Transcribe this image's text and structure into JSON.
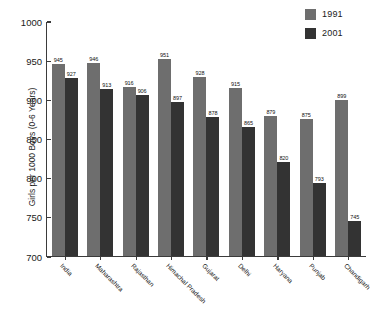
{
  "chart_data": {
    "type": "bar",
    "title": "",
    "subtitle": "",
    "xlabel": "",
    "ylabel": "Girls per 1000 Boys (0-6 Years)",
    "ylim": [
      700,
      1000
    ],
    "yticks": [
      700,
      750,
      800,
      850,
      900,
      950,
      1000
    ],
    "grid": false,
    "legend_position": "top-right",
    "categories": [
      "India",
      "Maharashtra",
      "Rajasthan",
      "Himachal Pradesh",
      "Gujarat",
      "Delhi",
      "Haryana",
      "Punjab",
      "Chandigarh"
    ],
    "series": [
      {
        "name": "1991",
        "color": "#6e6e6e",
        "values": [
          945,
          946,
          916,
          951,
          928,
          915,
          879,
          875,
          899
        ]
      },
      {
        "name": "2001",
        "color": "#333333",
        "values": [
          927,
          913,
          906,
          897,
          878,
          865,
          820,
          793,
          745
        ]
      }
    ]
  },
  "legend": {
    "items": [
      {
        "label": "1991",
        "color": "#6e6e6e"
      },
      {
        "label": "2001",
        "color": "#333333"
      }
    ]
  },
  "axis": {
    "y_title": "Girls per 1000 Boys (0-6 Years)",
    "y_tick_labels": [
      "1000",
      "950",
      "900",
      "850",
      "800",
      "750",
      "700"
    ]
  },
  "colors": {
    "axis": "#3b3b3b",
    "text": "#111111",
    "background": "#ffffff"
  }
}
